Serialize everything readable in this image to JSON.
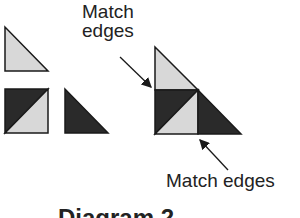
{
  "labels": {
    "top_line1": "Match",
    "top_line2": "edges",
    "bottom": "Match edges",
    "caption": "Diagram 2"
  },
  "colors": {
    "light_fill": "#d8d8d8",
    "dark_fill": "#2a2a2a",
    "stroke": "#1a1a1a"
  },
  "pieces": [
    {
      "name": "light-half-square-triangle",
      "fill": "light"
    },
    {
      "name": "half-square-triangle-unit",
      "fill": "dark+light"
    },
    {
      "name": "dark-half-square-triangle",
      "fill": "dark"
    }
  ]
}
